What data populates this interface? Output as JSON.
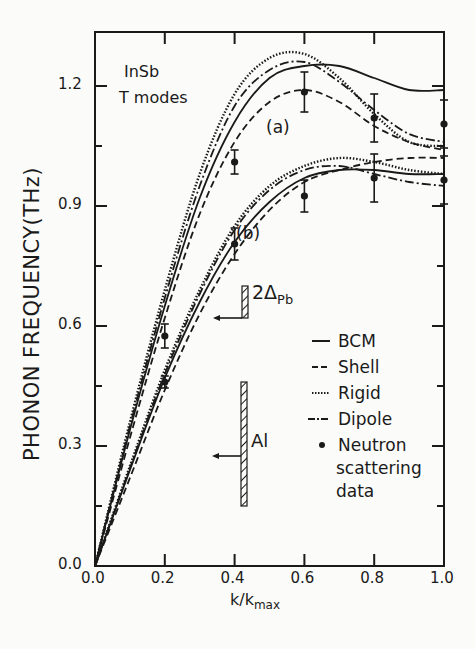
{
  "chart_data": {
    "type": "line",
    "title": "",
    "annotations": {
      "material": "InSb",
      "modes": "T modes",
      "branch_a_label": "(a)",
      "branch_b_label": "(b)",
      "gap_pb_label": "2Δ",
      "gap_pb_sub": "Pb",
      "gap_al_label": "Al",
      "gap_pb_range": [
        0.62,
        0.7
      ],
      "gap_al_range": [
        0.15,
        0.46
      ]
    },
    "xlabel": "k/k",
    "xlabel_sub": "max",
    "ylabel": "PHONON FREQUENCY(THz)",
    "xlim": [
      0.0,
      1.0
    ],
    "ylim": [
      0.0,
      1.3
    ],
    "xticks": [
      "0.0",
      "0.2",
      "0.4",
      "0.6",
      "0.8",
      "1.0"
    ],
    "yticks": [
      "0.0",
      "0.3",
      "0.6",
      "0.9",
      "1.2"
    ],
    "grid": false,
    "legend_position": "right-center",
    "legend": [
      "BCM",
      "Shell",
      "Rigid",
      "Dipole",
      "Neutron scattering data"
    ],
    "x": [
      0.0,
      0.1,
      0.2,
      0.3,
      0.4,
      0.5,
      0.6,
      0.7,
      0.8,
      0.9,
      1.0
    ],
    "series": [
      {
        "name": "BCM",
        "branch": "a",
        "style": "solid",
        "values": [
          0.0,
          0.34,
          0.65,
          0.92,
          1.11,
          1.22,
          1.25,
          1.25,
          1.22,
          1.19,
          1.19
        ]
      },
      {
        "name": "Shell",
        "branch": "a",
        "style": "dashed",
        "values": [
          0.0,
          0.32,
          0.62,
          0.88,
          1.06,
          1.16,
          1.19,
          1.16,
          1.1,
          1.06,
          1.04
        ]
      },
      {
        "name": "Rigid",
        "branch": "a",
        "style": "dotted",
        "values": [
          0.0,
          0.36,
          0.69,
          0.98,
          1.18,
          1.27,
          1.28,
          1.22,
          1.13,
          1.06,
          1.05
        ]
      },
      {
        "name": "Dipole",
        "branch": "a",
        "style": "dashdot",
        "values": [
          0.0,
          0.35,
          0.67,
          0.95,
          1.15,
          1.24,
          1.26,
          1.21,
          1.14,
          1.08,
          1.06
        ]
      },
      {
        "name": "BCM",
        "branch": "b",
        "style": "solid",
        "values": [
          0.0,
          0.24,
          0.47,
          0.66,
          0.81,
          0.91,
          0.97,
          0.99,
          0.99,
          0.98,
          0.98
        ]
      },
      {
        "name": "Shell",
        "branch": "b",
        "style": "dashed",
        "values": [
          0.0,
          0.22,
          0.44,
          0.63,
          0.78,
          0.89,
          0.96,
          0.99,
          1.01,
          1.02,
          1.02
        ]
      },
      {
        "name": "Rigid",
        "branch": "b",
        "style": "dotted",
        "values": [
          0.0,
          0.25,
          0.49,
          0.69,
          0.85,
          0.95,
          1.0,
          1.02,
          1.01,
          0.99,
          0.98
        ]
      },
      {
        "name": "Dipole",
        "branch": "b",
        "style": "dashdot",
        "values": [
          0.0,
          0.245,
          0.48,
          0.68,
          0.84,
          0.94,
          0.99,
          1.0,
          0.98,
          0.96,
          0.95
        ]
      }
    ],
    "neutron_data": {
      "name": "Neutron scattering data",
      "branch_a": [
        {
          "x": 0.2,
          "y": 0.575,
          "err": 0.03
        },
        {
          "x": 0.4,
          "y": 1.01,
          "err": 0.03
        },
        {
          "x": 0.6,
          "y": 1.185,
          "err": 0.05
        },
        {
          "x": 0.8,
          "y": 1.12,
          "err": 0.06
        },
        {
          "x": 1.0,
          "y": 1.105,
          "err": 0.06
        }
      ],
      "branch_b": [
        {
          "x": 0.2,
          "y": 0.46,
          "err": 0.01
        },
        {
          "x": 0.4,
          "y": 0.805,
          "err": 0.04
        },
        {
          "x": 0.6,
          "y": 0.925,
          "err": 0.04
        },
        {
          "x": 0.8,
          "y": 0.97,
          "err": 0.06
        },
        {
          "x": 1.0,
          "y": 0.965,
          "err": 0.06
        }
      ]
    }
  },
  "legend_items": {
    "bcm": "BCM",
    "shell": "Shell",
    "rigid": "Rigid",
    "dipole": "Dipole",
    "neutron_line1": "Neutron",
    "neutron_line2": "scattering",
    "neutron_line3": "data"
  }
}
